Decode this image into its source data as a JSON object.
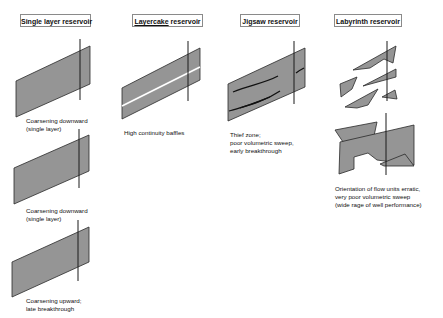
{
  "panels": [
    {
      "title": "Single layer reservoir",
      "cases": [
        {
          "caption_lines": [
            "Coarsening downward",
            "(single layer)"
          ]
        },
        {
          "caption_lines": [
            "Coarsening downward",
            "(single layer)"
          ]
        },
        {
          "caption_lines": [
            "Coarsening upward;",
            "late breakthrough"
          ]
        }
      ]
    },
    {
      "title_underlined": "Layercake",
      "title_rest": " reservoir",
      "cases": [
        {
          "caption_lines": [
            "High continuity baffles"
          ]
        }
      ]
    },
    {
      "title": "Jigsaw reservoir",
      "cases": [
        {
          "caption_lines": [
            "Thief zone;",
            "poor volumetric sweep,",
            "early breakthrough"
          ]
        }
      ]
    },
    {
      "title": "Labyrinth reservoir",
      "cases": [
        {
          "caption_lines": [
            "Orientation of flow units erratic,",
            "very poor volumetric sweep",
            "(wide rage of well performance)"
          ]
        }
      ]
    }
  ],
  "colors": {
    "fill": "#959595",
    "stroke": "#2a2a2a",
    "well": "#1a1a1a",
    "box_border": "#8a8a8a"
  }
}
